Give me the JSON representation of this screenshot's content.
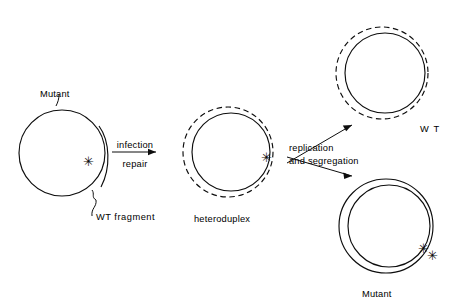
{
  "figure": {
    "background_color": "#ffffff",
    "line_color": "#0d0d0d"
  },
  "labels": {
    "mutant_left": "Mutant",
    "wt_fragment": "WT fragment",
    "infection": "infection",
    "repair": "repair",
    "heteroduplex": "heteroduplex",
    "replication": "replication",
    "and_segregation": "and  segregation",
    "wt_right": "W T",
    "mutant_right": "Mutant",
    "marker": "✳"
  },
  "stages": [
    {
      "id": "mutant-genome",
      "name": "Mutant",
      "description": "Single open circle representing the mutant genome with a WT fragment arc annealed on the right side",
      "circles": [
        {
          "style": "solid",
          "cx": 62,
          "cy": 153,
          "r": 43
        }
      ],
      "fragment_arc": {
        "style": "solid",
        "present": true
      },
      "markers": 1
    },
    {
      "id": "heteroduplex",
      "name": "heteroduplex",
      "description": "Solid inner circle (mutant strand) plus dashed outer circle (WT strand) with one mismatch marker",
      "circles": [
        {
          "style": "solid",
          "cx": 231,
          "cy": 152,
          "r": 39
        },
        {
          "style": "dashed",
          "cx": 228,
          "cy": 152,
          "r": 45
        }
      ],
      "markers": 1
    },
    {
      "id": "wt-product",
      "name": "W T",
      "description": "Solid inner circle plus dashed outer circle, no markers - wild type product",
      "circles": [
        {
          "style": "solid",
          "cx": 385,
          "cy": 73,
          "r": 40
        },
        {
          "style": "dashed",
          "cx": 382,
          "cy": 73,
          "r": 46
        }
      ],
      "markers": 0
    },
    {
      "id": "mutant-product",
      "name": "Mutant",
      "description": "Two concentric solid circles with two mismatch markers - mutant product",
      "circles": [
        {
          "style": "solid",
          "cx": 389,
          "cy": 226,
          "r": 41
        },
        {
          "style": "solid",
          "cx": 386,
          "cy": 226,
          "r": 47
        }
      ],
      "markers": 2
    }
  ],
  "arrows": [
    {
      "id": "infection-repair",
      "label_above": "infection",
      "label_below": "repair",
      "from": "mutant-genome",
      "to": "heteroduplex",
      "direction": "right"
    },
    {
      "id": "replication-segregation-up",
      "label_above": "replication",
      "label_below": "and  segregation",
      "from": "heteroduplex",
      "to": "wt-product",
      "direction": "up-right"
    },
    {
      "id": "replication-segregation-down",
      "label_above": "replication",
      "label_below": "and  segregation",
      "from": "heteroduplex",
      "to": "mutant-product",
      "direction": "down-right"
    }
  ]
}
